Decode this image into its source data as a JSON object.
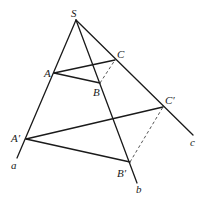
{
  "figure": {
    "colors": {
      "stroke": "#1a1a1a",
      "dashed": "#555555",
      "background": "#ffffff"
    },
    "points": {
      "S": {
        "label": "S",
        "x": 76,
        "y": 20
      },
      "A": {
        "label": "A",
        "x": 54,
        "y": 73
      },
      "B": {
        "label": "B",
        "x": 100,
        "y": 83
      },
      "C": {
        "label": "C",
        "x": 115,
        "y": 60
      },
      "A2": {
        "label": "A′",
        "x": 26,
        "y": 139
      },
      "B2": {
        "label": "B′",
        "x": 130,
        "y": 162
      },
      "C2": {
        "label": "C′",
        "x": 163,
        "y": 107
      }
    },
    "rays": [
      {
        "label": "a",
        "from": "S",
        "to": [
          17,
          158
        ]
      },
      {
        "label": "b",
        "from": "S",
        "to": [
          137,
          183
        ]
      },
      {
        "label": "c",
        "from": "S",
        "to": [
          193,
          135
        ]
      }
    ],
    "solid_edges": [
      [
        "A",
        "B"
      ],
      [
        "A",
        "C"
      ],
      [
        "A2",
        "B2"
      ],
      [
        "A2",
        "C2"
      ]
    ],
    "dashed_edges": [
      [
        "B",
        "C"
      ],
      [
        "B2",
        "C2"
      ]
    ],
    "labels": {
      "S": "S",
      "A": "A",
      "B": "B",
      "C": "C",
      "A2": "A′",
      "B2": "B′",
      "C2": "C′",
      "a": "a",
      "b": "b",
      "c": "c"
    }
  }
}
